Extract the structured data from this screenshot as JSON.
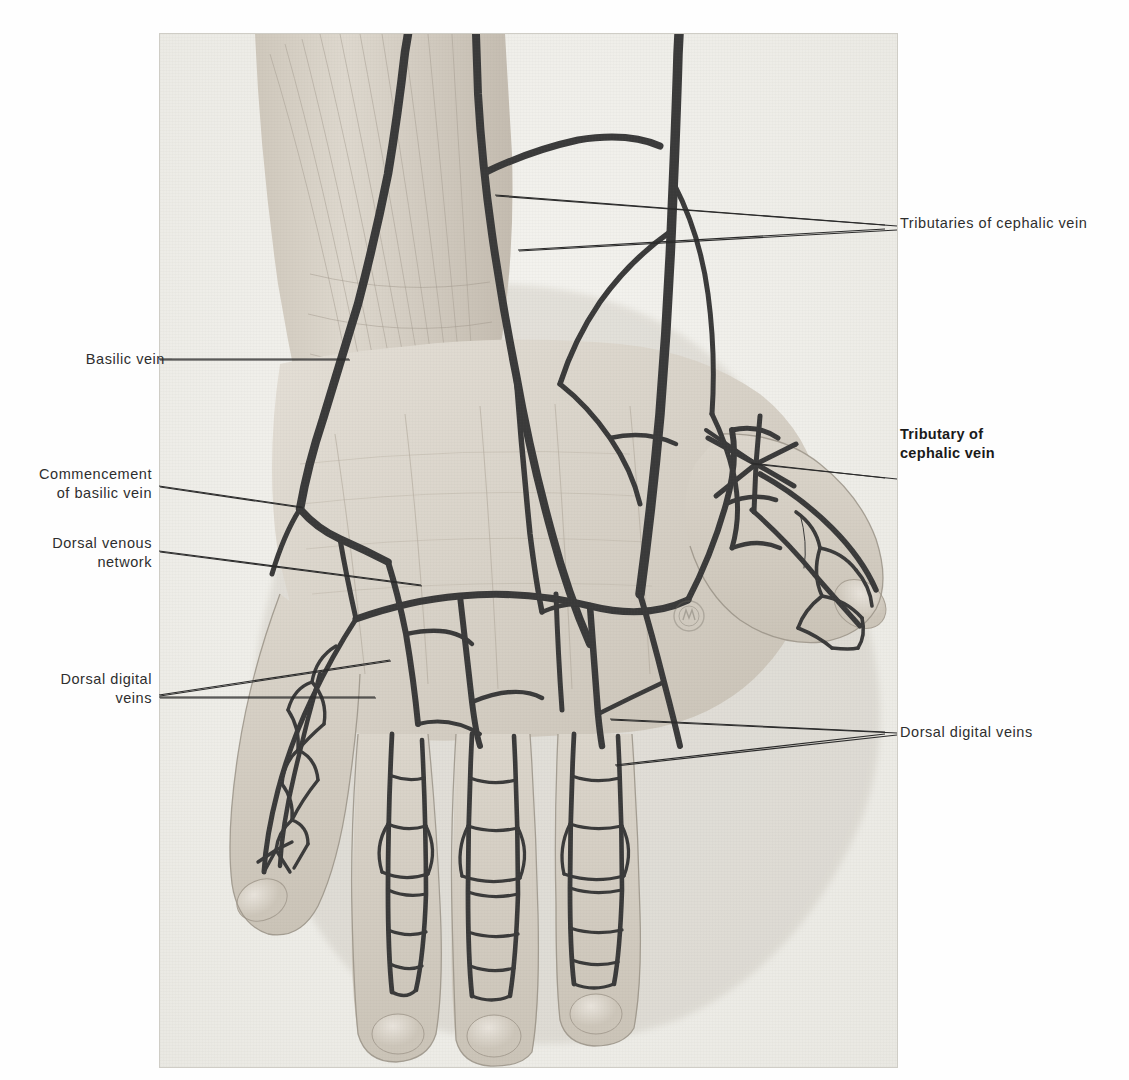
{
  "plate": {
    "subject": "dorsum of the right hand",
    "description": "Anatomical illustration of the dorsal venous network of the hand",
    "monogram": "artist-monogram-stamp",
    "background_color": "#f3f2ee",
    "vein_color": "#3a3a3a",
    "skin_color": "#ded9d0"
  },
  "labels": {
    "tributaries_cephalic": "Tributaries of cephalic vein",
    "tributary_cephalic": "Tributary of\ncephalic vein",
    "dorsal_digital_right": "Dorsal digital veins",
    "basilic": "Basilic vein",
    "commencement_basilic": "Commencement\nof basilic vein",
    "dorsal_venous_network": "Dorsal venous\nnetwork",
    "dorsal_digital_left": "Dorsal digital\nveins"
  }
}
